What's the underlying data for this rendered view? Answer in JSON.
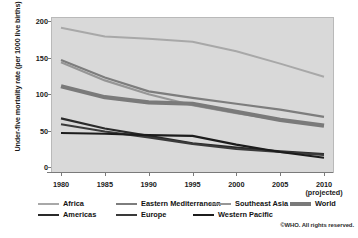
{
  "chart_data": {
    "type": "line",
    "title": "",
    "subtitle": "",
    "xlabel": "",
    "ylabel": "Under-five mortality rate (per 1000 live births)",
    "x": [
      1980,
      1985,
      1990,
      1995,
      2000,
      2005,
      2010
    ],
    "xtick_labels": [
      "1980",
      "1985",
      "1990",
      "1995",
      "2000",
      "2005",
      "2010"
    ],
    "x_note": "(projected)",
    "xlim": [
      1980,
      2010
    ],
    "ylim": [
      0,
      200
    ],
    "ytick_labels": [
      "0",
      "50",
      "100",
      "150",
      "200"
    ],
    "yticks": [
      0,
      50,
      100,
      150,
      200
    ],
    "grid": false,
    "legend_position": "bottom",
    "plot_background": "#d9d9d9",
    "series": [
      {
        "name": "Africa",
        "color": "#a8a8a8",
        "width": 2.0,
        "values": [
          192,
          180,
          177,
          173,
          160,
          143,
          125
        ]
      },
      {
        "name": "Eastern Mediterranean",
        "color": "#7d7d7d",
        "width": 2.2,
        "values": [
          148,
          124,
          105,
          96,
          88,
          80,
          70
        ]
      },
      {
        "name": "Southeast Asia",
        "color": "#969696",
        "width": 2.2,
        "values": [
          145,
          120,
          101,
          86,
          75,
          66,
          58
        ]
      },
      {
        "name": "World",
        "color": "#7a7a7a",
        "width": 4.2,
        "values": [
          112,
          97,
          90,
          88,
          77,
          66,
          58
        ]
      },
      {
        "name": "Americas",
        "color": "#2a2a2a",
        "width": 2.1,
        "values": [
          68,
          54,
          44,
          34,
          28,
          23,
          19
        ]
      },
      {
        "name": "Europe",
        "color": "#3a3a3a",
        "width": 2.1,
        "values": [
          60,
          50,
          42,
          33,
          26,
          22,
          18
        ]
      },
      {
        "name": "Western Pacific",
        "color": "#1c1c1c",
        "width": 2.1,
        "values": [
          48,
          47,
          45,
          44,
          32,
          22,
          14
        ]
      }
    ]
  },
  "legend": {
    "items": [
      {
        "label": "Africa"
      },
      {
        "label": "Eastern Mediterranean"
      },
      {
        "label": "Southeast Asia"
      },
      {
        "label": "World"
      },
      {
        "label": "Americas"
      },
      {
        "label": "Europe"
      },
      {
        "label": "Western Pacific"
      }
    ]
  },
  "footer": {
    "copyright": "©WHO. All rights reserved."
  }
}
